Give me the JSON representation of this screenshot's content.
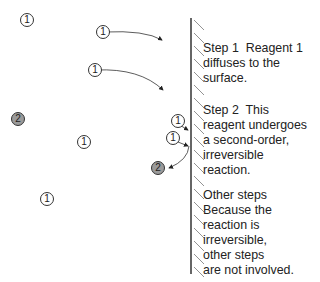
{
  "molecules": [
    {
      "label": "1",
      "type": "reagent-1",
      "x": 20,
      "y": 13
    },
    {
      "label": "1",
      "type": "reagent-1",
      "x": 96,
      "y": 25
    },
    {
      "label": "1",
      "type": "reagent-1",
      "x": 88,
      "y": 63
    },
    {
      "label": "2",
      "type": "reagent-2",
      "x": 11,
      "y": 112
    },
    {
      "label": "1",
      "type": "reagent-1",
      "x": 77,
      "y": 135
    },
    {
      "label": "1",
      "type": "reagent-1",
      "x": 171,
      "y": 114
    },
    {
      "label": "1",
      "type": "reagent-1",
      "x": 166,
      "y": 131
    },
    {
      "label": "2",
      "type": "reagent-2",
      "x": 151,
      "y": 161
    },
    {
      "label": "1",
      "type": "reagent-1",
      "x": 40,
      "y": 192
    }
  ],
  "steps": {
    "step1": [
      "Step 1  Reagent 1",
      "diffuses to the",
      "surface."
    ],
    "step2": [
      "Step 2  This",
      "reagent undergoes",
      "a second-order,",
      "irreversible",
      "reaction."
    ],
    "other": [
      "Other steps",
      "Because the",
      "reaction is",
      "irreversible,",
      "other steps",
      "are not involved."
    ]
  },
  "colors": {
    "line": "#333333",
    "reagent2_fill": "#9a9a9a"
  }
}
